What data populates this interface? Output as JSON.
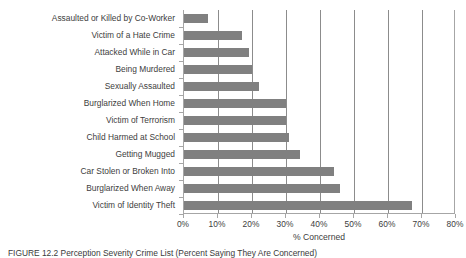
{
  "chart_data": {
    "type": "bar",
    "orientation": "horizontal",
    "title": "",
    "xlabel": "% Concerned",
    "ylabel": "",
    "xlim": [
      0,
      80
    ],
    "xticks": [
      0,
      10,
      20,
      30,
      40,
      50,
      60,
      70,
      80
    ],
    "xtick_labels": [
      "0%",
      "10%",
      "20%",
      "30%",
      "40%",
      "50%",
      "60%",
      "70%",
      "80%"
    ],
    "grid": true,
    "grid_axis": "x",
    "legend": "none",
    "bar_color": "#808080",
    "categories": [
      "Assaulted or Killed by Co-Worker",
      "Victim of a Hate Crime",
      "Attacked While in Car",
      "Being Murdered",
      "Sexually Assaulted",
      "Burglarized When Home",
      "Victim of Terrorism",
      "Child Harmed at School",
      "Getting Mugged",
      "Car Stolen or Broken Into",
      "Burglarized When Away",
      "Victim of Identity Theft"
    ],
    "values": [
      7,
      17,
      19,
      20,
      22,
      30,
      30,
      31,
      34,
      44,
      46,
      67
    ],
    "value_labels": [
      "7%",
      "17%",
      "19%",
      "20%",
      "22%",
      "30%",
      "30%",
      "31%",
      "34%",
      "44%",
      "46%",
      "67%"
    ]
  },
  "axis": {
    "x_title": "% Concerned"
  },
  "caption": {
    "text": "FIGURE 12.2  Perception Severity Crime List (Percent Saying They Are Concerned)"
  }
}
